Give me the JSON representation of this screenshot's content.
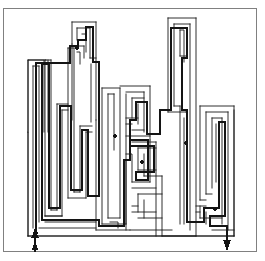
{
  "figure": {
    "kind": "maze-puzzle-solved",
    "title": "Solved maze puzzle",
    "frame": {
      "label": "figure-border",
      "stroke_color": "#808080",
      "stroke_width": 1,
      "x": 3.5,
      "y": 8.5,
      "width": 253,
      "height": 243
    },
    "canvas": {
      "width": 265,
      "height": 261,
      "background": "#ffffff"
    },
    "artifacts": [
      {
        "name": "scan-speck",
        "x": 18,
        "y": 2,
        "width": 5,
        "height": 4,
        "color": "#7a7a7a"
      }
    ]
  },
  "maze": {
    "label": "maze",
    "bounds": {
      "x": 28,
      "y": 18,
      "width": 206,
      "height": 218
    },
    "wall_color": "#1a1a1a",
    "wall_width": 0.9,
    "wall_color_soft": "#6e6e6e",
    "solution": {
      "label": "solution-path",
      "color": "#141414",
      "width": 2.6,
      "start_label": "entrance",
      "end_label": "exit"
    },
    "entrance_arrow": {
      "label": "entrance-arrow",
      "direction": "up",
      "x": 35,
      "y_tail": 252,
      "y_head": 228,
      "color": "#141414"
    },
    "exit_arrow": {
      "label": "exit-arrow",
      "direction": "down",
      "x": 227,
      "y_tail": 228,
      "y_head": 250,
      "color": "#141414"
    },
    "dead_end_dots": [
      {
        "x": 77,
        "y": 48
      },
      {
        "x": 115,
        "y": 136
      },
      {
        "x": 142,
        "y": 162
      },
      {
        "x": 186,
        "y": 143
      },
      {
        "x": 215,
        "y": 209
      },
      {
        "x": 36,
        "y": 233
      }
    ],
    "walls": [
      "M28,18 L28,236",
      "M234,18 L234,236",
      "M28,236 L234,236",
      "M34,44 L34,226",
      "M41,44 L41,226",
      "M34,44 L41,44",
      "M34,226 L41,226",
      "M47,36 L47,218",
      "M54,36 L54,218",
      "M47,36 L54,36",
      "M47,218 L54,218",
      "M60,30 L60,210",
      "M67,30 L67,210",
      "M60,30 L67,30",
      "M60,210 L67,210",
      "M73,22 L73,150",
      "M80,22 L80,150",
      "M73,22 L80,22",
      "M73,150 L80,150",
      "M86,56 L86,226",
      "M93,56 L93,226",
      "M86,56 L93,56",
      "M86,226 L93,226",
      "M99,70 L99,218",
      "M106,70 L106,218",
      "M99,70 L106,70",
      "M99,218 L106,218",
      "M112,84 L112,230",
      "M119,84 L119,230",
      "M112,84 L119,84",
      "M125,62 L125,222",
      "M132,62 L132,222",
      "M125,62 L132,62",
      "M138,96 L138,214",
      "M145,96 L145,214",
      "M151,76 L151,230",
      "M158,76 L158,230",
      "M164,26 L164,206",
      "M171,26 L171,206",
      "M164,26 L171,26",
      "M177,40 L177,198",
      "M184,40 L184,198",
      "M190,108 L190,228",
      "M197,108 L197,228",
      "M203,120 L203,214",
      "M210,120 L210,214",
      "M216,90 L216,222",
      "M223,90 L223,222",
      "M28,228 L234,228",
      "M28,220 L120,220"
    ]
  }
}
